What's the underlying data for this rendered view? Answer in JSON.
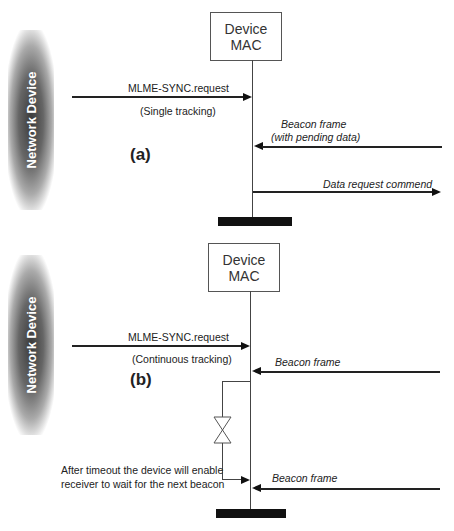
{
  "diagram": {
    "type": "sequence",
    "panels": [
      {
        "id": "a",
        "label": "(a)",
        "actor_left": "Network Device",
        "actor_right": "Device MAC",
        "actor_right_lines": [
          "Device",
          "MAC"
        ],
        "messages": [
          {
            "text": "MLME-SYNC.request",
            "subtext": "(Single tracking)",
            "direction": "to-mac",
            "from": "Network Device"
          },
          {
            "text": "Beacon frame",
            "subtext": "(with pending data)",
            "direction": "to-mac",
            "from": "right"
          },
          {
            "text": "Data request commend",
            "direction": "from-mac",
            "to": "right"
          }
        ]
      },
      {
        "id": "b",
        "label": "(b)",
        "actor_left": "Network Device",
        "actor_right": "Device MAC",
        "actor_right_lines": [
          "Device",
          "MAC"
        ],
        "messages": [
          {
            "text": "MLME-SYNC.request",
            "subtext": "(Continuous tracking)",
            "direction": "to-mac",
            "from": "Network Device"
          },
          {
            "text": "Beacon frame",
            "direction": "to-mac",
            "from": "right"
          },
          {
            "text": "Beacon frame",
            "direction": "to-mac",
            "from": "right"
          }
        ],
        "timeout_note": [
          "After timeout the device will enable",
          "receiver to wait for the next beacon"
        ]
      }
    ]
  }
}
